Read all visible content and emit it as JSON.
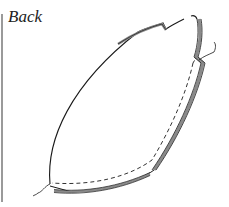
{
  "diagram": {
    "label": "Back",
    "type": "sewing-pattern-piece",
    "colors": {
      "outline": "#1a1a1a",
      "seam_fill": "#8a8a8a",
      "dashed": "#333333",
      "rule": "#9a9a9a"
    }
  }
}
